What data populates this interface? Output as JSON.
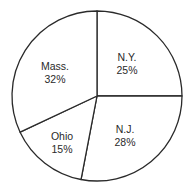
{
  "chart_data": {
    "type": "pie",
    "title": "",
    "start_angle_deg": 0,
    "direction": "clockwise",
    "categories": [
      "N.Y.",
      "N.J.",
      "Ohio",
      "Mass."
    ],
    "values": [
      25,
      28,
      15,
      32
    ],
    "labels": [
      "25%",
      "28%",
      "15%",
      "32%"
    ],
    "legend": "none",
    "colors": {
      "fill": "#ffffff",
      "stroke": "#2a2a2a"
    }
  },
  "slices": [
    {
      "name": "N.Y.",
      "pct": "25%"
    },
    {
      "name": "N.J.",
      "pct": "28%"
    },
    {
      "name": "Ohio",
      "pct": "15%"
    },
    {
      "name": "Mass.",
      "pct": "32%"
    }
  ]
}
